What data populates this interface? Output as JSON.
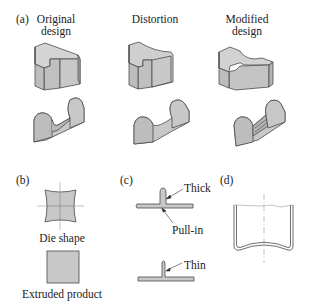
{
  "colors": {
    "fill": "#c8c8c8",
    "fill_dark": "#b0b0b0",
    "stroke": "#4a4a4a",
    "guide": "#999999"
  },
  "panel_a": {
    "letter": "(a)",
    "columns": [
      {
        "line1": "Original",
        "line2": "design"
      },
      {
        "line1": "Distortion",
        "line2": ""
      },
      {
        "line1": "Modified",
        "line2": "design"
      }
    ]
  },
  "panel_b": {
    "letter": "(b)",
    "die_label": "Die shape",
    "product_label": "Extruded product"
  },
  "panel_c": {
    "letter": "(c)",
    "thick_label": "Thick",
    "pullin_label": "Pull-in",
    "thin_label": "Thin"
  },
  "panel_d": {
    "letter": "(d)"
  }
}
